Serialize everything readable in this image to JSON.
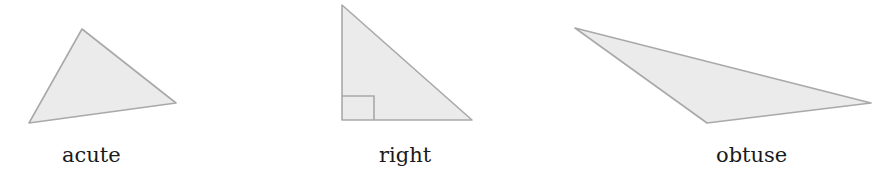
{
  "diagram": {
    "colors": {
      "fill": "#ebebeb",
      "stroke": "#a9a9a9",
      "text": "#1a1a1a",
      "background": "#ffffff"
    },
    "triangles": [
      {
        "id": "acute",
        "label": "acute",
        "points": "82,29 176,103 29,123",
        "label_pos": {
          "x": 62,
          "y": 145
        }
      },
      {
        "id": "right",
        "label": "right",
        "points": "342,5 472,120 342,120",
        "right_angle_marker": {
          "x": 342,
          "y": 96,
          "size": 32,
          "height": 24
        },
        "label_pos": {
          "x": 379,
          "y": 145
        }
      },
      {
        "id": "obtuse",
        "label": "obtuse",
        "points": "575,28 871,103 707,123",
        "label_pos": {
          "x": 716,
          "y": 145
        }
      }
    ]
  }
}
